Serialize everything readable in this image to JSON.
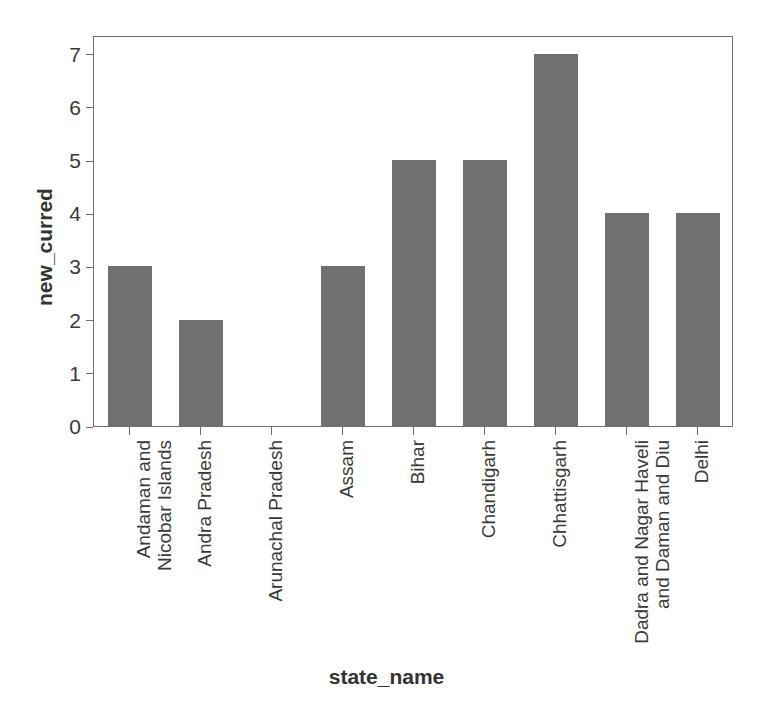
{
  "chart_data": {
    "type": "bar",
    "title": "",
    "subtitle": "",
    "xlabel": "state_name",
    "ylabel": "new_curred",
    "categories": [
      "Andaman and Nicobar Islands",
      "Andra Pradesh",
      "Arunachal Pradesh",
      "Assam",
      "Bihar",
      "Chandigarh",
      "Chhattisgarh",
      "Dadra and Nagar Haveli and Daman and Diu",
      "Delhi"
    ],
    "category_label_lines": [
      [
        "Andaman and",
        "Nicobar Islands"
      ],
      [
        "Andra Pradesh"
      ],
      [
        "Arunachal Pradesh"
      ],
      [
        "Assam"
      ],
      [
        "Bihar"
      ],
      [
        "Chandigarh"
      ],
      [
        "Chhattisgarh"
      ],
      [
        "Dadra and Nagar Haveli",
        "and Daman and Diu"
      ],
      [
        "Delhi"
      ]
    ],
    "values": [
      3,
      2,
      0,
      3,
      5,
      5,
      7,
      4,
      4
    ],
    "ylim": [
      0,
      7.35
    ],
    "yticks": [
      0,
      1,
      2,
      3,
      4,
      5,
      6,
      7
    ],
    "ytick_labels": [
      "0",
      "1",
      "2",
      "3",
      "4",
      "5",
      "6",
      "7"
    ],
    "grid": false,
    "legend": null,
    "bar_color": "#707070",
    "frame_color": "#6e6e6e",
    "background_color": "#ffffff",
    "text_color": "#3a3a3a",
    "annotations": []
  }
}
